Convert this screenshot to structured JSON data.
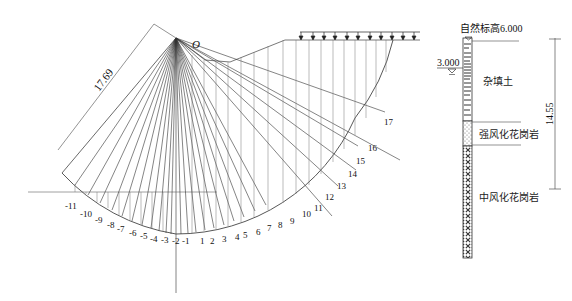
{
  "diagram": {
    "type": "slope-stability-slice-method",
    "center_label": "O",
    "radius_label": "17.69",
    "slice_labels_negative": [
      "-11",
      "-10",
      "-9",
      "-8",
      "-7",
      "-6",
      "-5",
      "-4",
      "-3",
      "-2",
      "-1"
    ],
    "slice_labels_positive": [
      "1",
      "2",
      "3",
      "4",
      "5",
      "6",
      "7",
      "8",
      "9",
      "10",
      "11",
      "12",
      "13",
      "14",
      "15",
      "16",
      "17"
    ],
    "load_arrow_count": 11
  },
  "borehole": {
    "top_elevation_label": "自然标高6.000",
    "water_level_label": "3.000",
    "depth_dimension": "14.55",
    "layers": [
      {
        "name": "杂填土",
        "pattern": "horizontal-dashes"
      },
      {
        "name": "强风化花岗岩",
        "pattern": "dots"
      },
      {
        "name": "中风化花岗岩",
        "pattern": "cross-hatch"
      }
    ]
  },
  "caption": ""
}
